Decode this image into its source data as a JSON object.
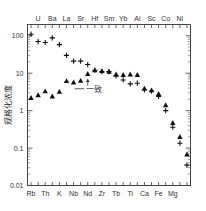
{
  "chart_data": {
    "type": "scatter",
    "title": "",
    "xlabel": "",
    "ylabel": "规格化浓度",
    "yscale": "log",
    "ylim": [
      0.01,
      200
    ],
    "ytick_labels": [
      "100",
      "10",
      "1",
      "0.1",
      "0.01"
    ],
    "ytick_values": [
      100,
      10,
      1,
      0.1,
      0.01
    ],
    "grid": false,
    "legend_position": "none",
    "annotations": [
      {
        "text": "一致",
        "x_element": "Nd",
        "y": 3.2
      }
    ],
    "top_axis_labels": [
      "U",
      "Ba",
      "La",
      "Sr",
      "Hf",
      "Sm",
      "Yb",
      "Al",
      "Sc",
      "Co",
      "Ni"
    ],
    "bottom_axis_labels": [
      "Rb",
      "Th",
      "K",
      "Nb",
      "Nd",
      "Zr",
      "Tb",
      "Ti",
      "Ca",
      "Fe",
      "Mg"
    ],
    "elements": [
      "Rb",
      "U",
      "Th",
      "Ba",
      "K",
      "La",
      "Nb",
      "Sr",
      "Nd",
      "Hf",
      "Zr",
      "Sm",
      "Tb",
      "Yb",
      "Ti",
      "Al",
      "Ca",
      "Sc",
      "Fe",
      "Co",
      "Mg",
      "Ni"
    ],
    "series": [
      {
        "name": "plus",
        "marker": "plus",
        "color": "#111111",
        "values": [
          110,
          70,
          66,
          88,
          58,
          30,
          21,
          21,
          17,
          12,
          11,
          11,
          8.5,
          6.6,
          5.2,
          5.4,
          3.6,
          3.3,
          2.4,
          1.0,
          0.36,
          0.135,
          0.035
        ]
      },
      {
        "name": "triangle",
        "marker": "triangle",
        "color": "#111111",
        "values": [
          2.2,
          2.6,
          3.3,
          2.4,
          3.2,
          6.2,
          5.7,
          6.3,
          9.6,
          12,
          11.5,
          11,
          9.3,
          9.0,
          9.3,
          9.0,
          3.9,
          3.5,
          2.8,
          1.4,
          0.47,
          0.2,
          0.068
        ]
      }
    ]
  }
}
